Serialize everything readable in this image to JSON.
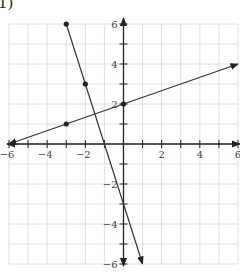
{
  "problem_label": "1)",
  "chart_data": {
    "type": "line",
    "title": "",
    "xlabel": "",
    "ylabel": "",
    "xlim": [
      -6,
      6
    ],
    "ylim": [
      -6,
      6
    ],
    "grid": true,
    "x_tick_labels": [
      "-6",
      "-4",
      "-2",
      "2",
      "4",
      "6"
    ],
    "y_tick_labels": [
      "6",
      "4",
      "2",
      "-2",
      "-4",
      "-6"
    ],
    "series": [
      {
        "name": "line-1",
        "equation": "y = -3x - 3",
        "start": [
          -3,
          6
        ],
        "end": [
          1,
          -6
        ],
        "arrow_end": true,
        "points": [
          [
            -3,
            6
          ],
          [
            -2,
            3
          ]
        ]
      },
      {
        "name": "line-2",
        "equation": "y = (1/3)x + 2",
        "start": [
          -6,
          0
        ],
        "end": [
          6,
          4
        ],
        "arrow_start": true,
        "arrow_end": true,
        "points": [
          [
            -3,
            1
          ],
          [
            0,
            2
          ]
        ]
      }
    ],
    "colors": {
      "grid": "#d8d8d8",
      "axis": "#222222",
      "line": "#333333"
    }
  }
}
